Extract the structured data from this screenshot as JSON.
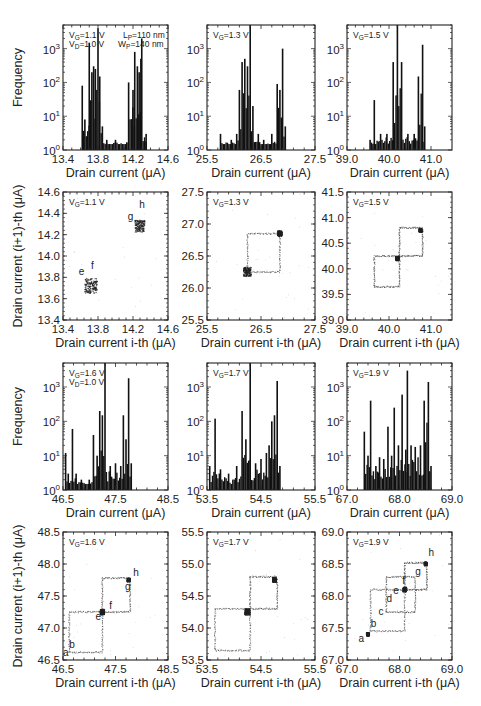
{
  "figure": {
    "hist_xlabel": "Drain current (μA)",
    "hist_ylabel": "Frequency",
    "scatter_xlabel": "Drain current i-th (μA)",
    "scatter_ylabel": "Drain current (i+1)-th (μA)",
    "bar_color": "#111111",
    "point_color": "#222222"
  },
  "chart_data": [
    {
      "id": "hist-vg-1.1",
      "type": "bar",
      "row": 0,
      "col": 0,
      "title": "",
      "annotations": [
        "V_G=1.1 V",
        "V_D=1.0 V",
        "L_P=110 nm",
        "W_P=140 nm"
      ],
      "xlabel": "Drain current (μA)",
      "ylabel": "Frequency",
      "yscale": "log",
      "xlim": [
        13.4,
        14.6
      ],
      "ylim": [
        1,
        5000
      ],
      "xticks": [
        "13.4",
        "13.8",
        "14.2",
        "14.6"
      ],
      "yticks": [
        "10^0",
        "10^1",
        "10^2",
        "10^3"
      ],
      "peaks": [
        [
          13.62,
          80
        ],
        [
          13.65,
          8
        ],
        [
          13.7,
          1500
        ],
        [
          13.73,
          200
        ],
        [
          13.75,
          300
        ],
        [
          13.77,
          250
        ],
        [
          13.8,
          4000
        ],
        [
          13.82,
          150
        ],
        [
          13.85,
          5
        ],
        [
          13.9,
          2
        ],
        [
          14.0,
          2
        ],
        [
          14.15,
          100
        ],
        [
          14.2,
          60
        ],
        [
          14.22,
          800
        ],
        [
          14.25,
          300
        ],
        [
          14.27,
          200
        ],
        [
          14.29,
          500
        ],
        [
          14.3,
          2000
        ],
        [
          14.35,
          3
        ]
      ]
    },
    {
      "id": "hist-vg-1.3",
      "type": "bar",
      "row": 0,
      "col": 1,
      "annotations": [
        "V_G=1.3 V"
      ],
      "xlabel": "Drain current (μA)",
      "ylabel": "",
      "yscale": "log",
      "xlim": [
        25.5,
        27.5
      ],
      "ylim": [
        1,
        5000
      ],
      "xticks": [
        "25.5",
        "26.5",
        "27.5"
      ],
      "yticks": [
        "10^0",
        "10^1",
        "10^2",
        "10^3"
      ],
      "peaks": [
        [
          25.75,
          3
        ],
        [
          25.95,
          2
        ],
        [
          26.05,
          3
        ],
        [
          26.1,
          60
        ],
        [
          26.15,
          400
        ],
        [
          26.2,
          500
        ],
        [
          26.25,
          300
        ],
        [
          26.3,
          5000
        ],
        [
          26.35,
          20
        ],
        [
          26.45,
          3
        ],
        [
          26.55,
          2
        ],
        [
          26.7,
          3
        ],
        [
          26.8,
          90
        ],
        [
          26.85,
          60
        ],
        [
          26.9,
          1000
        ],
        [
          26.95,
          5
        ]
      ]
    },
    {
      "id": "hist-vg-1.5",
      "type": "bar",
      "row": 0,
      "col": 2,
      "annotations": [
        "V_G=1.5 V"
      ],
      "xlabel": "Drain current (μA)",
      "ylabel": "",
      "yscale": "log",
      "xlim": [
        39.0,
        41.5
      ],
      "ylim": [
        1,
        5000
      ],
      "xticks": [
        "39.0",
        "40.0",
        "41.0"
      ],
      "yticks": [
        "10^0",
        "10^1",
        "10^2",
        "10^3"
      ],
      "peaks": [
        [
          39.55,
          2
        ],
        [
          39.65,
          30
        ],
        [
          39.8,
          3
        ],
        [
          39.95,
          3
        ],
        [
          40.1,
          400
        ],
        [
          40.2,
          5000
        ],
        [
          40.3,
          400
        ],
        [
          40.45,
          3
        ],
        [
          40.6,
          3
        ],
        [
          40.7,
          150
        ],
        [
          40.8,
          1300
        ],
        [
          40.85,
          5
        ]
      ]
    },
    {
      "id": "scatter-vg-1.1",
      "type": "scatter",
      "row": 1,
      "col": 0,
      "annotations": [
        "V_G=1.1 V"
      ],
      "point_labels": [
        "e",
        "f",
        "g",
        "h"
      ],
      "xlabel": "Drain current i-th (μA)",
      "ylabel": "Drain current (i+1)-th (μA)",
      "xlim": [
        13.4,
        14.6
      ],
      "ylim": [
        13.4,
        14.6
      ],
      "xticks": [
        "13.4",
        "13.8",
        "14.2",
        "14.6"
      ],
      "yticks": [
        "13.4",
        "13.6",
        "13.8",
        "14.0",
        "14.2",
        "14.4",
        "14.6"
      ],
      "clusters": [
        [
          13.72,
          13.72,
          0.1
        ],
        [
          14.28,
          14.28,
          0.08
        ]
      ],
      "labels_pos": {
        "e": [
          13.58,
          13.82
        ],
        "f": [
          13.72,
          13.88
        ],
        "g": [
          14.14,
          14.34
        ],
        "h": [
          14.27,
          14.45
        ]
      }
    },
    {
      "id": "scatter-vg-1.3",
      "type": "scatter",
      "row": 1,
      "col": 1,
      "annotations": [
        "V_G=1.3 V"
      ],
      "xlabel": "Drain current i-th (μA)",
      "ylabel": "",
      "xlim": [
        25.5,
        27.5
      ],
      "ylim": [
        25.5,
        27.5
      ],
      "xticks": [
        "25.5",
        "26.5",
        "27.5"
      ],
      "yticks": [
        "25.5",
        "26.0",
        "26.5",
        "27.0",
        "27.5"
      ],
      "clusters": [
        [
          26.25,
          26.25,
          0.1
        ],
        [
          26.85,
          26.85,
          0.06
        ]
      ],
      "loops": [
        [
          26.25,
          26.85
        ]
      ]
    },
    {
      "id": "scatter-vg-1.5",
      "type": "scatter",
      "row": 1,
      "col": 2,
      "annotations": [
        "V_G=1.5 V"
      ],
      "xlabel": "Drain current i-th (μA)",
      "ylabel": "",
      "xlim": [
        39.0,
        41.5
      ],
      "ylim": [
        39.0,
        41.5
      ],
      "xticks": [
        "39.0",
        "40.0",
        "41.0"
      ],
      "yticks": [
        "39.0",
        "39.5",
        "40.0",
        "40.5",
        "41.0",
        "41.5"
      ],
      "clusters": [
        [
          40.2,
          40.2,
          0.06
        ],
        [
          40.75,
          40.75,
          0.05
        ]
      ],
      "loops": [
        [
          39.65,
          40.25
        ],
        [
          40.25,
          40.8
        ]
      ]
    },
    {
      "id": "hist-vg-1.6",
      "type": "bar",
      "row": 2,
      "col": 0,
      "annotations": [
        "V_G=1.6 V",
        "V_D=1.0 V"
      ],
      "xlabel": "Drain current (μA)",
      "ylabel": "Frequency",
      "yscale": "log",
      "xlim": [
        46.5,
        48.5
      ],
      "ylim": [
        1,
        5000
      ],
      "xticks": [
        "46.5",
        "47.5",
        "48.5"
      ],
      "yticks": [
        "10^0",
        "10^1",
        "10^2",
        "10^3"
      ],
      "peaks": [
        [
          46.55,
          12
        ],
        [
          46.6,
          3
        ],
        [
          46.68,
          60
        ],
        [
          46.75,
          3
        ],
        [
          46.85,
          2
        ],
        [
          47.0,
          2
        ],
        [
          47.08,
          40
        ],
        [
          47.15,
          10
        ],
        [
          47.2,
          200
        ],
        [
          47.25,
          150
        ],
        [
          47.3,
          5000
        ],
        [
          47.4,
          5
        ],
        [
          47.5,
          6
        ],
        [
          47.6,
          5
        ],
        [
          47.65,
          150
        ],
        [
          47.7,
          30
        ],
        [
          47.75,
          1800
        ],
        [
          47.8,
          6
        ]
      ]
    },
    {
      "id": "hist-vg-1.7",
      "type": "bar",
      "row": 2,
      "col": 1,
      "annotations": [
        "V_G=1.7 V"
      ],
      "xlabel": "Drain current (μA)",
      "ylabel": "",
      "yscale": "log",
      "xlim": [
        53.5,
        55.5
      ],
      "ylim": [
        1,
        5000
      ],
      "xticks": [
        "53.5",
        "54.5",
        "55.5"
      ],
      "yticks": [
        "10^0",
        "10^1",
        "10^2",
        "10^3"
      ],
      "peaks": [
        [
          53.55,
          5
        ],
        [
          53.65,
          120
        ],
        [
          53.75,
          4
        ],
        [
          53.9,
          3
        ],
        [
          54.05,
          5
        ],
        [
          54.15,
          200
        ],
        [
          54.22,
          30
        ],
        [
          54.3,
          5000
        ],
        [
          54.4,
          6
        ],
        [
          54.5,
          8
        ],
        [
          54.6,
          12
        ],
        [
          54.65,
          20
        ],
        [
          54.7,
          100
        ],
        [
          54.75,
          150
        ],
        [
          54.8,
          1500
        ],
        [
          54.85,
          5
        ]
      ]
    },
    {
      "id": "hist-vg-1.9",
      "type": "bar",
      "row": 2,
      "col": 2,
      "annotations": [
        "V_G=1.9 V"
      ],
      "xlabel": "Drain current (μA)",
      "ylabel": "",
      "yscale": "log",
      "xlim": [
        67.0,
        69.0
      ],
      "ylim": [
        1,
        5000
      ],
      "xticks": [
        "67.0",
        "68.0",
        "69.0"
      ],
      "yticks": [
        "10^0",
        "10^1",
        "10^2",
        "10^3"
      ],
      "peaks": [
        [
          67.33,
          50
        ],
        [
          67.4,
          10
        ],
        [
          67.45,
          400
        ],
        [
          67.55,
          5
        ],
        [
          67.62,
          9
        ],
        [
          67.7,
          8
        ],
        [
          67.78,
          70
        ],
        [
          67.85,
          10
        ],
        [
          67.9,
          250
        ],
        [
          67.98,
          20
        ],
        [
          68.05,
          600
        ],
        [
          68.12,
          15
        ],
        [
          68.15,
          3000
        ],
        [
          68.22,
          20
        ],
        [
          68.3,
          18
        ],
        [
          68.4,
          20
        ],
        [
          68.47,
          400
        ],
        [
          68.55,
          1400
        ],
        [
          68.6,
          5
        ]
      ]
    },
    {
      "id": "scatter-vg-1.6",
      "type": "scatter",
      "row": 3,
      "col": 0,
      "annotations": [
        "V_G=1.6 V"
      ],
      "point_labels": [
        "a",
        "b",
        "e",
        "f",
        "g",
        "h"
      ],
      "xlabel": "Drain current i-th (μA)",
      "ylabel": "Drain current (i+1)-th (μA)",
      "xlim": [
        46.5,
        48.5
      ],
      "ylim": [
        46.5,
        48.5
      ],
      "xticks": [
        "46.5",
        "47.5",
        "48.5"
      ],
      "yticks": [
        "46.5",
        "47.0",
        "47.5",
        "48.0",
        "48.5"
      ],
      "clusters": [
        [
          47.25,
          47.25,
          0.06
        ],
        [
          47.75,
          47.75,
          0.04
        ]
      ],
      "loops": [
        [
          46.62,
          47.25
        ],
        [
          47.25,
          47.78
        ]
      ],
      "labels_pos": {
        "a": [
          46.5,
          46.57
        ],
        "b": [
          46.62,
          46.68
        ],
        "e": [
          47.12,
          47.12
        ],
        "f": [
          47.38,
          47.3
        ],
        "g": [
          47.68,
          47.6
        ],
        "h": [
          47.84,
          47.82
        ]
      }
    },
    {
      "id": "scatter-vg-1.7",
      "type": "scatter",
      "row": 3,
      "col": 1,
      "annotations": [
        "V_G=1.7 V"
      ],
      "xlabel": "Drain current i-th (μA)",
      "ylabel": "",
      "xlim": [
        53.5,
        55.5
      ],
      "ylim": [
        53.5,
        55.5
      ],
      "xticks": [
        "53.5",
        "54.5",
        "55.5"
      ],
      "yticks": [
        "53.5",
        "54.0",
        "54.5",
        "55.0",
        "55.5"
      ],
      "clusters": [
        [
          54.25,
          54.25,
          0.07
        ],
        [
          54.75,
          54.75,
          0.05
        ]
      ],
      "loops": [
        [
          53.65,
          54.3
        ],
        [
          54.3,
          54.8
        ]
      ]
    },
    {
      "id": "scatter-vg-1.9",
      "type": "scatter",
      "row": 3,
      "col": 2,
      "annotations": [
        "V_G=1.9 V"
      ],
      "point_labels": [
        "a",
        "b",
        "c",
        "d",
        "e",
        "f",
        "g",
        "h"
      ],
      "xlabel": "Drain current i-th (μA)",
      "ylabel": "",
      "xlim": [
        67.0,
        69.0
      ],
      "ylim": [
        67.0,
        69.0
      ],
      "xticks": [
        "67.0",
        "68.0",
        "69.0"
      ],
      "yticks": [
        "67.0",
        "67.5",
        "68.0",
        "68.5",
        "69.0"
      ],
      "clusters": [
        [
          67.4,
          67.4,
          0.04
        ],
        [
          68.1,
          68.1,
          0.05
        ],
        [
          68.5,
          68.5,
          0.04
        ]
      ],
      "loops": [
        [
          67.45,
          68.1
        ],
        [
          67.75,
          68.3
        ],
        [
          68.1,
          68.52
        ]
      ],
      "labels_pos": {
        "a": [
          67.22,
          67.28
        ],
        "b": [
          67.45,
          67.52
        ],
        "c": [
          67.6,
          67.7
        ],
        "d": [
          67.75,
          67.9
        ],
        "e": [
          67.88,
          68.03
        ],
        "f": [
          68.05,
          68.18
        ],
        "g": [
          68.3,
          68.33
        ],
        "h": [
          68.55,
          68.62
        ]
      }
    }
  ],
  "layout": {
    "cols": [
      [
        63,
        168
      ],
      [
        207,
        315
      ],
      [
        347,
        452
      ]
    ],
    "rows": [
      [
        25,
        150
      ],
      [
        192,
        320
      ],
      [
        363,
        490
      ],
      [
        532,
        660
      ]
    ]
  }
}
